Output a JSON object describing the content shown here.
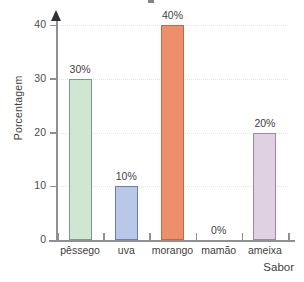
{
  "chart_data": {
    "type": "bar",
    "title": "",
    "xlabel": "Sabor",
    "ylabel": "Porcentagem",
    "categories": [
      "pêssego",
      "uva",
      "morango",
      "mamão",
      "ameixa"
    ],
    "values": [
      30,
      10,
      40,
      0,
      20
    ],
    "value_labels": [
      "30%",
      "10%",
      "40%",
      "0%",
      "20%"
    ],
    "ylim": [
      0,
      40
    ],
    "ytick_labels": [
      "0",
      "10",
      "20",
      "30",
      "40"
    ],
    "ytick_values": [
      0,
      10,
      20,
      30,
      40
    ],
    "grid": true,
    "legend": "none",
    "bar_colors": [
      "#cfe6d2",
      "#b9c8e8",
      "#ee8f6b",
      "#ffffff",
      "#dfd0e2"
    ],
    "bar_border_colors": [
      "#7a9c80",
      "#6b7fae",
      "#c0664a",
      "#ffffff",
      "#9b8aa0"
    ]
  },
  "axis": {
    "y_title": "Porcentagem",
    "x_title": "Sabor"
  }
}
